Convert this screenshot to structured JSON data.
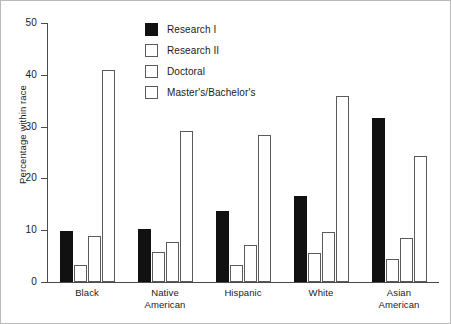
{
  "chart_data": {
    "type": "bar",
    "title": "",
    "xlabel": "",
    "ylabel": "Percentage within race",
    "ylim": [
      0,
      50
    ],
    "yticks": [
      0,
      10,
      20,
      30,
      40,
      50
    ],
    "ytick_labels": [
      "0",
      "10",
      "20",
      "30",
      "40",
      "50"
    ],
    "grid": false,
    "legend_position": "upper center",
    "categories": [
      "Black",
      "Native American",
      "Hispanic",
      "White",
      "Asian American"
    ],
    "category_lines": [
      [
        "Black"
      ],
      [
        "Native",
        "American"
      ],
      [
        "Hispanic"
      ],
      [
        "White"
      ],
      [
        "Asian",
        "American"
      ]
    ],
    "series": [
      {
        "name": "Research I",
        "fill": "black",
        "color": "#111111",
        "values": [
          9.8,
          10.3,
          13.7,
          16.6,
          31.7
        ]
      },
      {
        "name": "Research II",
        "fill": "white",
        "color": "#ffffff",
        "values": [
          3.2,
          5.7,
          3.2,
          5.6,
          4.4
        ]
      },
      {
        "name": "Doctoral",
        "fill": "white",
        "color": "#ffffff",
        "values": [
          8.8,
          7.7,
          7.2,
          9.6,
          8.5
        ]
      },
      {
        "name": "Master's/Bachelor's",
        "fill": "white",
        "color": "#ffffff",
        "values": [
          41.0,
          29.2,
          28.4,
          35.9,
          24.3
        ]
      }
    ]
  },
  "legend": {
    "items": [
      {
        "label": "Research I",
        "fill": "black"
      },
      {
        "label": "Research II",
        "fill": "white"
      },
      {
        "label": "Doctoral",
        "fill": "white"
      },
      {
        "label": "Master's/Bachelor's",
        "fill": "white"
      }
    ]
  },
  "colors": {
    "bar_black": "#111111",
    "bar_white": "#ffffff",
    "bar_outline": "#5a5a5a",
    "axis": "#4a4a4a",
    "text": "#1a1a1a",
    "frame": "#b9b9b9",
    "background": "#ffffff"
  }
}
